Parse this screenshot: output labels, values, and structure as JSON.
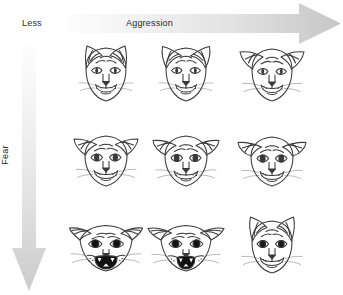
{
  "figure": {
    "background_color": "#ffffff",
    "line_color": "#333333"
  },
  "axes": {
    "horizontal": {
      "label": "Aggression",
      "low_label": "Less",
      "direction": "left-to-right",
      "gradient_from": "#f7f7f7",
      "gradient_to": "#c9c9c9",
      "arrow_name": "aggression-arrow"
    },
    "vertical": {
      "label": "Fear",
      "direction": "top-to-bottom",
      "gradient_from": "#fafafa",
      "gradient_to": "#cfcfcf",
      "arrow_name": "fear-arrow"
    }
  },
  "grid": {
    "rows": 3,
    "cols": 3,
    "row_meanings": [
      "low fear",
      "medium fear",
      "high fear"
    ],
    "col_meanings": [
      "low aggression",
      "medium aggression",
      "high aggression"
    ],
    "cells": [
      {
        "id": "cat-r1c1",
        "row": 1,
        "col": 1,
        "state": "neutral / relaxed",
        "ears": "upright forward",
        "pupils": "narrow slit",
        "mouth": "closed"
      },
      {
        "id": "cat-r1c2",
        "row": 1,
        "col": 2,
        "state": "alert aggression",
        "ears": "upright rotated slightly out",
        "pupils": "narrow slit",
        "mouth": "closed"
      },
      {
        "id": "cat-r1c3",
        "row": 1,
        "col": 3,
        "state": "offensive aggression",
        "ears": "rotated outward, backs showing",
        "pupils": "narrow slit",
        "mouth": "closed, whiskers forward"
      },
      {
        "id": "cat-r2c1",
        "row": 2,
        "col": 1,
        "state": "mild fear",
        "ears": "tilted out, partly lowered",
        "pupils": "medium oval",
        "mouth": "closed"
      },
      {
        "id": "cat-r2c2",
        "row": 2,
        "col": 2,
        "state": "fear with aggression",
        "ears": "lowered, rotated out",
        "pupils": "medium oval",
        "mouth": "closed"
      },
      {
        "id": "cat-r2c3",
        "row": 2,
        "col": 3,
        "state": "defensive aggression",
        "ears": "flattened sideways",
        "pupils": "medium oval",
        "mouth": "closed"
      },
      {
        "id": "cat-r3c1",
        "row": 3,
        "col": 1,
        "state": "terrified",
        "ears": "fully flattened back",
        "pupils": "fully dilated black",
        "mouth": "wide open, hissing"
      },
      {
        "id": "cat-r3c2",
        "row": 3,
        "col": 2,
        "state": "terrified defensive",
        "ears": "flattened back, tips out",
        "pupils": "fully dilated black",
        "mouth": "open, teeth bared"
      },
      {
        "id": "cat-r3c3",
        "row": 3,
        "col": 3,
        "state": "fearful aggression",
        "ears": "upright, tense",
        "pupils": "dilated round",
        "mouth": "closed"
      }
    ]
  }
}
